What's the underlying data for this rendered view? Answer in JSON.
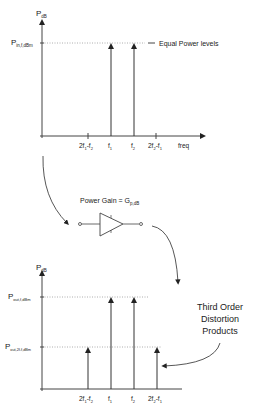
{
  "top_plot": {
    "y_axis_label": "P",
    "y_axis_sub": "dB",
    "level_label": "P",
    "level_sub": "in,f,dBm",
    "annotation": "Equal Power levels",
    "x_ticks": [
      {
        "main": "2f",
        "sub1": "1",
        "mid": "-f",
        "sub2": "2"
      },
      {
        "main": "f",
        "sub1": "1"
      },
      {
        "main": "f",
        "sub1": "2"
      },
      {
        "main": "2f",
        "sub1": "2",
        "mid": "-f",
        "sub2": "1"
      }
    ],
    "x_axis_label": "freq"
  },
  "amplifier": {
    "label": "Power Gain = G",
    "label_sub": "p,dB"
  },
  "bottom_plot": {
    "y_axis_label": "P",
    "y_axis_sub": "dB",
    "level_high_label": "P",
    "level_high_sub": "out,f,dBm",
    "level_low_label": "P",
    "level_low_sub": "out,2f-f,dBm",
    "x_ticks": [
      {
        "main": "2f",
        "sub1": "1",
        "mid": "-f",
        "sub2": "2"
      },
      {
        "main": "f",
        "sub1": "1"
      },
      {
        "main": "f",
        "sub1": "2"
      },
      {
        "main": "2f",
        "sub1": "2",
        "mid": "-f",
        "sub2": "1"
      }
    ]
  },
  "callout": {
    "line1": "Third Order",
    "line2": "Distortion",
    "line3": "Products"
  }
}
